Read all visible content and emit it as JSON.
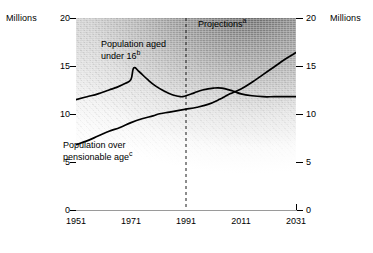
{
  "axis_unit_left": "Millions",
  "axis_unit_right": "Millions",
  "annotations": {
    "projections": "Projections",
    "projections_note": "a",
    "under16_line1": "Population aged",
    "under16_line2": "under 16",
    "under16_note": "b",
    "pension_line1": "Population over",
    "pension_line2": "pensionable age",
    "pension_note": "c"
  },
  "chart_data": {
    "type": "line",
    "title": "",
    "xlabel": "",
    "ylabel": "Millions",
    "xlim": [
      1951,
      2031
    ],
    "ylim": [
      0,
      20
    ],
    "grid": false,
    "legend": "inline-annotations",
    "xticks": [
      1951,
      1971,
      1991,
      2011,
      2031
    ],
    "yticks": [
      0,
      5,
      10,
      15,
      20
    ],
    "projection_start": 1991,
    "projection_divider_style": "dashed-vertical",
    "series": [
      {
        "name": "Population aged under 16",
        "note": "b",
        "x": [
          1951,
          1955,
          1959,
          1963,
          1966,
          1969,
          1971,
          1972,
          1974,
          1977,
          1980,
          1983,
          1986,
          1989,
          1991,
          1994,
          1997,
          2001,
          2004,
          2008,
          2011,
          2015,
          2019,
          2023,
          2027,
          2031
        ],
        "values": [
          11.5,
          11.8,
          12.1,
          12.5,
          12.8,
          13.2,
          13.6,
          14.8,
          14.4,
          13.6,
          12.9,
          12.4,
          12.0,
          11.8,
          11.9,
          12.2,
          12.5,
          12.7,
          12.7,
          12.4,
          12.1,
          11.9,
          11.8,
          11.8,
          11.8,
          11.8
        ]
      },
      {
        "name": "Population over pensionable age",
        "note": "c",
        "x": [
          1951,
          1955,
          1959,
          1963,
          1967,
          1971,
          1975,
          1979,
          1981,
          1985,
          1989,
          1991,
          1995,
          1999,
          2003,
          2007,
          2011,
          2015,
          2019,
          2023,
          2027,
          2031
        ],
        "values": [
          6.8,
          7.2,
          7.7,
          8.2,
          8.6,
          9.1,
          9.5,
          9.8,
          10.0,
          10.2,
          10.4,
          10.5,
          10.7,
          11.0,
          11.5,
          12.1,
          12.6,
          13.3,
          14.1,
          14.9,
          15.7,
          16.4
        ]
      }
    ]
  }
}
